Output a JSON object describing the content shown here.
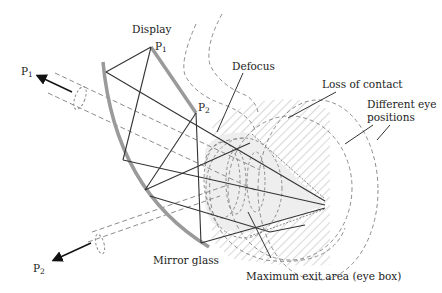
{
  "diagram": {
    "type": "optical-ray-diagram",
    "labels": {
      "display": "Display",
      "defocus": "Defocus",
      "loss_of_contact": "Loss of contact",
      "different_eye_positions_line1": "Different eye",
      "different_eye_positions_line2": "positions",
      "mirror_glass": "Mirror glass",
      "max_exit_area": "Maximum exit area (eye box)"
    },
    "points": {
      "p1_display": {
        "base": "P",
        "sub": "1"
      },
      "p2_display": {
        "base": "P",
        "sub": "2"
      },
      "p1_arrow": {
        "base": "P",
        "sub": "1"
      },
      "p2_arrow": {
        "base": "P",
        "sub": "2"
      }
    },
    "colors": {
      "mirror": "#9a9a9a",
      "ray": "#333333",
      "dashed": "#8c8c8c",
      "hatch": "#d6d6d6",
      "eyebox_fill": "#ececec",
      "text": "#222222"
    }
  }
}
